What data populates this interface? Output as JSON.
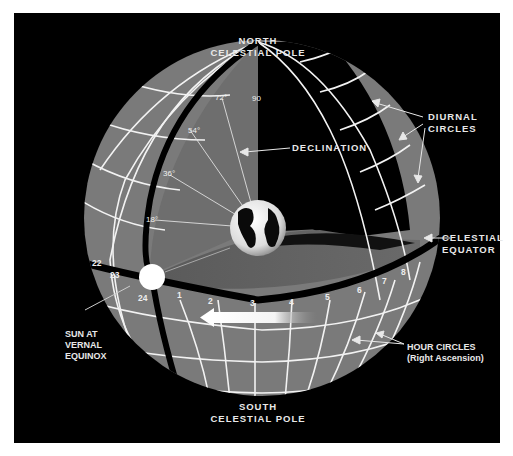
{
  "diagram": {
    "background_color": "#000000",
    "sphere_color": "#7a7a7a",
    "grid_line_color": "#f2f2f2",
    "labels": {
      "north_pole": [
        "NORTH",
        "CELESTIAL POLE"
      ],
      "south_pole": [
        "SOUTH",
        "CELESTIAL POLE"
      ],
      "declination": "DECLINATION",
      "diurnal_circles": [
        "DIURNAL",
        "CIRCLES"
      ],
      "celestial_equator": [
        "CELESTIAL",
        "EQUATOR"
      ],
      "sun": [
        "SUN AT",
        "VERNAL",
        "EQUINOX"
      ],
      "hour_circles": [
        "HOUR CIRCLES",
        "(Right Ascension)"
      ]
    },
    "declination_marks": [
      "90",
      "72°",
      "54°",
      "36°",
      "18°"
    ],
    "hour_marks": [
      "22",
      "23",
      "24",
      "1",
      "2",
      "3",
      "4",
      "5",
      "6",
      "7",
      "8"
    ]
  }
}
